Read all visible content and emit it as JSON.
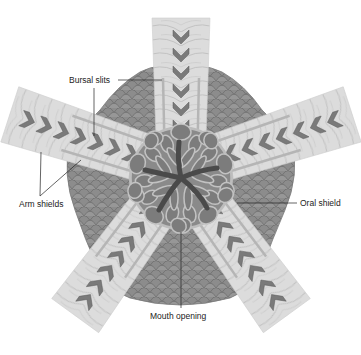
{
  "diagram": {
    "labels": {
      "bursal_slits": "Bursal slits",
      "arm_shields": "Arm shields",
      "oral_shield": "Oral shield",
      "mouth_opening": "Mouth opening"
    },
    "colors": {
      "background": "#ffffff",
      "disc_scales": "#8a8a8a",
      "disc_scale_outline": "#6e6e6e",
      "arm": "#d9d9d9",
      "arm_plate_lines": "#c4c4c4",
      "arm_shield": "#7a7a7a",
      "oral_plates": "#7c7c7c",
      "plate_outline": "#b8b8b8",
      "mouth_star": "#4a4a4a",
      "leader_line": "#222222",
      "text": "#222222"
    },
    "arm_count": 5
  }
}
